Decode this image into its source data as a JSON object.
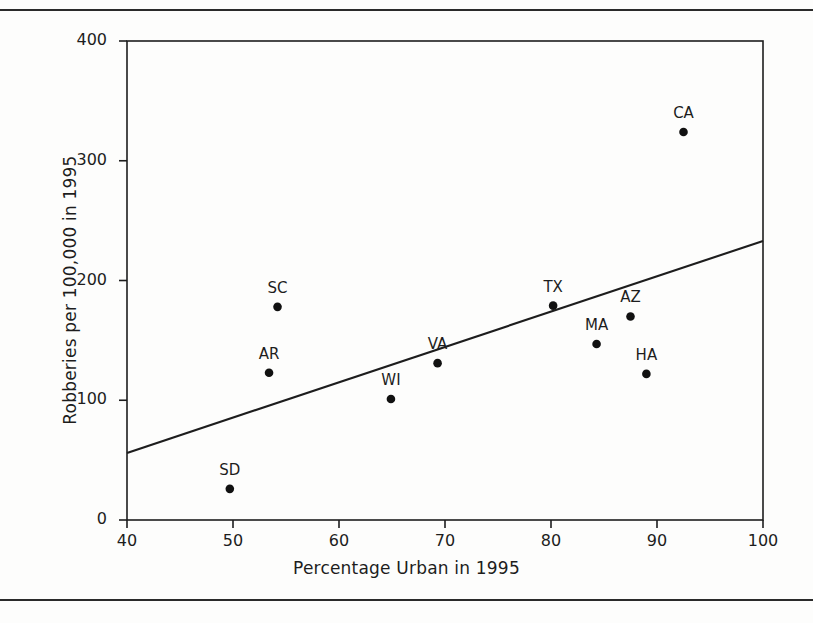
{
  "figure": {
    "background_color": "#fdfdfc",
    "ink_color": "#1d1d1d",
    "top_rule": "horizontal-rule",
    "bottom_rule": "horizontal-rule"
  },
  "chart_data": {
    "type": "scatter",
    "title": "",
    "xlabel": "Percentage Urban in 1995",
    "ylabel": "Robberies per 100,000 in 1995",
    "xlim": [
      40,
      100
    ],
    "ylim": [
      0,
      400
    ],
    "xticks": [
      40,
      50,
      60,
      70,
      80,
      90,
      100
    ],
    "yticks": [
      0,
      100,
      200,
      300,
      400
    ],
    "xtick_labels": [
      "40",
      "50",
      "60",
      "70",
      "80",
      "90",
      "100"
    ],
    "ytick_labels": [
      "0",
      "100",
      "200",
      "300",
      "400"
    ],
    "grid": false,
    "legend": null,
    "frame": "box",
    "points": [
      {
        "label": "CA",
        "x": 92.5,
        "y": 324
      },
      {
        "label": "SC",
        "x": 54.2,
        "y": 178
      },
      {
        "label": "TX",
        "x": 80.2,
        "y": 179
      },
      {
        "label": "AZ",
        "x": 87.5,
        "y": 170
      },
      {
        "label": "MA",
        "x": 84.3,
        "y": 147
      },
      {
        "label": "VA",
        "x": 69.3,
        "y": 131
      },
      {
        "label": "AR",
        "x": 53.4,
        "y": 123
      },
      {
        "label": "HA",
        "x": 89.0,
        "y": 122
      },
      {
        "label": "WI",
        "x": 64.9,
        "y": 101
      },
      {
        "label": "SD",
        "x": 49.7,
        "y": 26
      }
    ],
    "regression_line": {
      "x_start": 40,
      "y_start": 56,
      "x_end": 100,
      "y_end": 233
    }
  }
}
